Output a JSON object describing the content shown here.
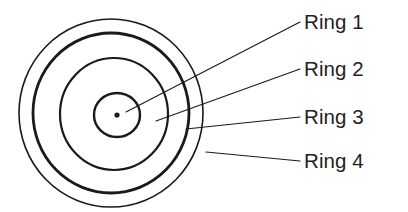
{
  "diagram": {
    "type": "concentric-rings-target",
    "background_color": "#ffffff",
    "stroke_color": "#1a1a1a",
    "center": {
      "x": 117,
      "y": 115
    },
    "center_dot": {
      "r": 2.6,
      "label": "center-dot"
    },
    "rings": [
      {
        "id": "ring-1",
        "label": "Ring 1",
        "order": 1,
        "position": "innermost",
        "cx": 117,
        "cy": 115,
        "rx": 23,
        "ry": 22,
        "stroke_width": 2.4,
        "leader": {
          "x1": 126,
          "y1": 112,
          "x2": 300,
          "y2": 22
        }
      },
      {
        "id": "ring-2",
        "label": "Ring 2",
        "order": 2,
        "cx": 114,
        "cy": 114,
        "rx": 54,
        "ry": 56,
        "stroke_width": 2.2,
        "leader": {
          "x1": 156,
          "y1": 121,
          "x2": 300,
          "y2": 69
        }
      },
      {
        "id": "ring-3",
        "label": "Ring 3",
        "order": 3,
        "cx": 111,
        "cy": 113,
        "rx": 78,
        "ry": 80,
        "stroke_width": 2.8,
        "leader": {
          "x1": 186,
          "y1": 129,
          "x2": 300,
          "y2": 117
        }
      },
      {
        "id": "ring-4",
        "label": "Ring 4",
        "order": 4,
        "position": "outermost",
        "cx": 111,
        "cy": 113,
        "rx": 92,
        "ry": 94,
        "stroke_width": 1.6,
        "leader": {
          "x1": 206,
          "y1": 152,
          "x2": 300,
          "y2": 161
        }
      }
    ],
    "labels": {
      "ring_1": "Ring 1",
      "ring_2": "Ring 2",
      "ring_3": "Ring 3",
      "ring_4": "Ring 4"
    }
  }
}
